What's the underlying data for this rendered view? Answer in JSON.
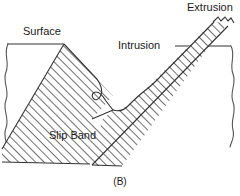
{
  "figure": {
    "caption": "(B)",
    "labels": {
      "surface": "Surface",
      "intrusion": "Intrusion",
      "extrusion": "Extrusion",
      "slip_band": "Slip Band"
    },
    "colors": {
      "line": "#333333",
      "hatch": "#555555",
      "background": "#ffffff"
    }
  }
}
